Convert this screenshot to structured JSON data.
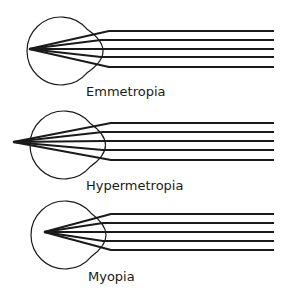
{
  "colors": {
    "stroke": "#1a1a1a",
    "background": "#ffffff"
  },
  "panels": [
    {
      "id": "emmetropia",
      "label": "Emmetropia",
      "focus": "on retina",
      "label_pos": {
        "x": 86,
        "y": 85
      },
      "eye": {
        "cx": 61,
        "cy": 51,
        "r": 34,
        "cornea_tip_x": 117
      },
      "focal_point": {
        "x": 29,
        "y": 49
      },
      "ray_y": [
        31,
        40,
        49,
        57,
        67
      ],
      "ray_end_x": 274
    },
    {
      "id": "hypermetropia",
      "label": "Hypermetropia",
      "focus": "behind retina",
      "label_pos": {
        "x": 86,
        "y": 179
      },
      "eye": {
        "cx": 64,
        "cy": 145,
        "r": 34,
        "cornea_tip_x": 119
      },
      "focal_point": {
        "x": 13,
        "y": 142
      },
      "ray_y": [
        123,
        132,
        141,
        150,
        160
      ],
      "ray_end_x": 274
    },
    {
      "id": "myopia",
      "label": "Myopia",
      "focus": "in front of retina",
      "label_pos": {
        "x": 88,
        "y": 270
      },
      "eye": {
        "cx": 65,
        "cy": 235,
        "r": 34,
        "cornea_tip_x": 119
      },
      "focal_point": {
        "x": 44,
        "y": 232
      },
      "ray_y": [
        214,
        223,
        232,
        241,
        250
      ],
      "ray_end_x": 274
    }
  ]
}
